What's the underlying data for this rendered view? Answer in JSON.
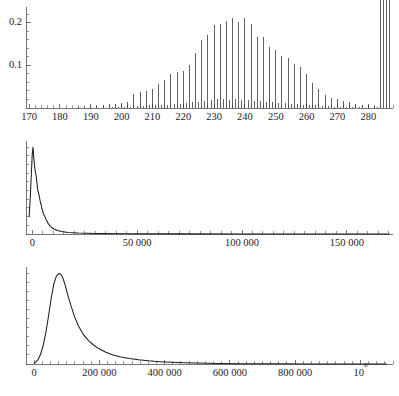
{
  "figure": {
    "name": "three-panel-distribution-figure",
    "background": "#ffffff",
    "ink_color": "#1d1d1f",
    "panel_count": 3
  },
  "chart_data": [
    {
      "id": "panel-1",
      "type": "bar",
      "title": "",
      "subtitle": "",
      "xlabel": "",
      "ylabel": "",
      "grid": false,
      "legend": null,
      "annotations": [],
      "xlim": [
        169,
        288
      ],
      "ylim": [
        0,
        0.235
      ],
      "x_major_ticks": [
        170,
        180,
        190,
        200,
        210,
        220,
        230,
        240,
        250,
        260,
        270,
        280
      ],
      "x_major_tick_labels": [
        "170",
        "180",
        "190",
        "200",
        "210",
        "220",
        "230",
        "240",
        "250",
        "260",
        "270",
        "280"
      ],
      "x_minor_step": 2,
      "y_major_ticks": [
        0.1,
        0.2
      ],
      "y_major_tick_labels": [
        "0.1",
        "0.2"
      ],
      "y_minor_step": 0.02,
      "bar_width_px": 1.1,
      "categories": [
        170,
        171,
        172,
        173,
        174,
        175,
        176,
        177,
        178,
        179,
        180,
        181,
        182,
        183,
        184,
        185,
        186,
        187,
        188,
        189,
        190,
        191,
        192,
        193,
        194,
        195,
        196,
        197,
        198,
        199,
        200,
        201,
        202,
        203,
        204,
        205,
        206,
        207,
        208,
        209,
        210,
        211,
        212,
        213,
        214,
        215,
        216,
        217,
        218,
        219,
        220,
        221,
        222,
        223,
        224,
        225,
        226,
        227,
        228,
        229,
        230,
        231,
        232,
        233,
        234,
        235,
        236,
        237,
        238,
        239,
        240,
        241,
        242,
        243,
        244,
        245,
        246,
        247,
        248,
        249,
        250,
        251,
        252,
        253,
        254,
        255,
        256,
        257,
        258,
        259,
        260,
        261,
        262,
        263,
        264,
        265,
        266,
        267,
        268,
        269,
        270,
        271,
        272,
        273,
        274,
        275,
        276,
        277,
        278,
        279,
        280,
        281,
        282,
        283,
        284,
        285,
        286,
        287
      ],
      "values": [
        0.0,
        0.0,
        0.0,
        0.0,
        0.0,
        0.0,
        0.0,
        0.0,
        0.0,
        0.0,
        0.0,
        0.0,
        0.0,
        0.0,
        0.001,
        0.0,
        0.002,
        0.0,
        0.002,
        0.0,
        0.004,
        0.0,
        0.004,
        0.001,
        0.006,
        0.001,
        0.009,
        0.002,
        0.009,
        0.002,
        0.012,
        0.003,
        0.014,
        0.003,
        0.032,
        0.004,
        0.038,
        0.005,
        0.041,
        0.006,
        0.044,
        0.006,
        0.056,
        0.007,
        0.066,
        0.008,
        0.079,
        0.009,
        0.084,
        0.009,
        0.087,
        0.012,
        0.102,
        0.013,
        0.129,
        0.014,
        0.159,
        0.017,
        0.171,
        0.018,
        0.195,
        0.02,
        0.198,
        0.021,
        0.205,
        0.019,
        0.212,
        0.022,
        0.203,
        0.019,
        0.211,
        0.018,
        0.197,
        0.017,
        0.168,
        0.016,
        0.167,
        0.014,
        0.143,
        0.013,
        0.136,
        0.012,
        0.122,
        0.011,
        0.118,
        0.01,
        0.104,
        0.009,
        0.096,
        0.008,
        0.079,
        0.007,
        0.058,
        0.006,
        0.044,
        0.005,
        0.031,
        0.004,
        0.024,
        0.003,
        0.021,
        0.003,
        0.016,
        0.002,
        0.013,
        0.002,
        0.01,
        0.002,
        0.008,
        0.001,
        0.006,
        0.001,
        0.004,
        0.003
      ],
      "values_secondary_comb": [
        0.0,
        0.0,
        0.0,
        0.0,
        0.0,
        0.0,
        0.0,
        0.0,
        0.0,
        0.0,
        0.0,
        0.0,
        0.0,
        0.0,
        0.0,
        0.0,
        0.0,
        0.0,
        0.0,
        0.0,
        0.0,
        0.0,
        0.0,
        0.0,
        0.0,
        0.0,
        0.0,
        0.0,
        0.0,
        0.0,
        0.0,
        0.0,
        0.0,
        0.0,
        0.0,
        0.0,
        0.0,
        0.0,
        0.0,
        0.0,
        0.0,
        0.0,
        0.0,
        0.0,
        0.0,
        0.0,
        0.0,
        0.0,
        0.0,
        0.0,
        0.0,
        0.0,
        0.0,
        0.0,
        0.0,
        0.0,
        0.0,
        0.0,
        0.0,
        0.0,
        0.0,
        0.0,
        0.0,
        0.0,
        0.0,
        0.0,
        0.0,
        0.0,
        0.0,
        0.0,
        0.0,
        0.0,
        0.0,
        0.0,
        0.0,
        0.0,
        0.0,
        0.0,
        0.0,
        0.0,
        0.0,
        0.0,
        0.0,
        0.0,
        0.0,
        0.0,
        0.0,
        0.0,
        0.0,
        0.0,
        0.0,
        0.0,
        0.0,
        0.0,
        0.0,
        0.0,
        0.0,
        0.0,
        0.0,
        0.0,
        0.0,
        0.0,
        0.0,
        0.0,
        0.0,
        0.0,
        0.0,
        0.0,
        0.0,
        0.0,
        0.0,
        0.0,
        0.0,
        0.0,
        0.0,
        0.0,
        0.0,
        0.0
      ]
    },
    {
      "id": "panel-2",
      "type": "line",
      "title": "",
      "subtitle": "",
      "xlabel": "",
      "ylabel": "",
      "grid": false,
      "legend": null,
      "annotations": [],
      "xlim": [
        -3000,
        172000
      ],
      "ylim": [
        0,
        1.06
      ],
      "x_major_ticks": [
        0,
        50000,
        100000,
        150000
      ],
      "x_major_tick_labels": [
        "0",
        "50 000",
        "100 000",
        "150 000"
      ],
      "x_minor_step": 5000,
      "y_major_ticks": [],
      "y_major_tick_labels": [],
      "y_minor_step": 0.1,
      "x": [
        -1500,
        -900,
        -400,
        0,
        350,
        700,
        1000,
        1300,
        1600,
        1900,
        2100,
        2300,
        2500,
        2700,
        2900,
        3100,
        3300,
        3600,
        3900,
        4200,
        4500,
        4800,
        5200,
        5600,
        6000,
        6500,
        7000,
        7600,
        8300,
        9200,
        10500,
        12000,
        14000,
        17000,
        22000,
        30000,
        45000,
        70000,
        100000,
        130000,
        160000,
        170000
      ],
      "y": [
        0.2,
        0.45,
        0.72,
        0.93,
        1.0,
        0.88,
        0.8,
        0.74,
        0.7,
        0.66,
        0.6,
        0.58,
        0.52,
        0.5,
        0.48,
        0.46,
        0.44,
        0.4,
        0.36,
        0.34,
        0.3,
        0.28,
        0.24,
        0.22,
        0.2,
        0.17,
        0.15,
        0.12,
        0.1,
        0.075,
        0.055,
        0.04,
        0.028,
        0.018,
        0.011,
        0.006,
        0.003,
        0.0015,
        0.0008,
        0.0004,
        0.0002,
        0.0001
      ]
    },
    {
      "id": "panel-3",
      "type": "line",
      "title": "",
      "subtitle": "",
      "xlabel": "",
      "ylabel": "",
      "grid": false,
      "legend": null,
      "annotations": [],
      "xlim": [
        -25000,
        1100000
      ],
      "ylim": [
        0,
        1.06
      ],
      "x_major_ticks": [
        0,
        200000,
        400000,
        600000,
        800000,
        1000000
      ],
      "x_major_tick_labels": [
        "0",
        "200 000",
        "400 000",
        "600 000",
        "800 000",
        "10^6"
      ],
      "x_last_tick_mantissa": "10",
      "x_last_tick_exponent": "6",
      "x_minor_step": 25000,
      "y_major_ticks": [],
      "y_major_tick_labels": [],
      "y_minor_step": 0.1,
      "x": [
        0,
        5000,
        12000,
        20000,
        28000,
        36000,
        44000,
        52000,
        60000,
        68000,
        76000,
        82000,
        88000,
        96000,
        104000,
        114000,
        124000,
        136000,
        150000,
        166000,
        182000,
        200000,
        220000,
        242000,
        266000,
        292000,
        320000,
        350000,
        385000,
        420000,
        460000,
        500000,
        560000,
        640000,
        740000,
        860000,
        1000000,
        1080000
      ],
      "y": [
        0.01,
        0.02,
        0.05,
        0.11,
        0.21,
        0.35,
        0.53,
        0.72,
        0.88,
        0.97,
        1.0,
        0.99,
        0.95,
        0.86,
        0.75,
        0.63,
        0.52,
        0.42,
        0.33,
        0.26,
        0.21,
        0.165,
        0.13,
        0.1,
        0.078,
        0.06,
        0.046,
        0.035,
        0.026,
        0.019,
        0.014,
        0.01,
        0.006,
        0.0035,
        0.0018,
        0.0008,
        0.0003,
        0.0002
      ]
    }
  ],
  "bleed_through": {
    "visible": true,
    "line_1": "",
    "line_2": ""
  }
}
